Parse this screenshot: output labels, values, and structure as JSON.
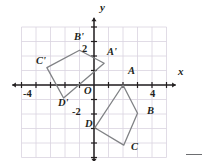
{
  "figure": {
    "origin_px": {
      "x": 94,
      "y": 85
    },
    "unit_px": 14.5,
    "colors": {
      "grid": "#d9d3e0",
      "axis": "#231f20",
      "shape": "#808285",
      "label": "#231f20",
      "background": "#ffffff"
    },
    "axes": {
      "x_label": "x",
      "y_label": "y",
      "x_tick_labels": [
        {
          "text": "-4",
          "value": -4
        },
        {
          "text": "4",
          "value": 4
        }
      ],
      "y_tick_labels": [
        {
          "text": "2",
          "value": 2
        },
        {
          "text": "-2",
          "value": -2
        }
      ],
      "origin_label": "O",
      "x_range": [
        -5.5,
        5.5
      ],
      "y_range": [
        -5.2,
        4.5
      ]
    },
    "shapes": [
      {
        "name": "ABCD",
        "vertices": [
          {
            "label": "A",
            "x": 2.0,
            "y": 0.0
          },
          {
            "label": "B",
            "x": 3.0,
            "y": -1.95
          },
          {
            "label": "C",
            "x": 2.05,
            "y": -4.15
          },
          {
            "label": "D",
            "x": 0.05,
            "y": -2.95
          }
        ]
      },
      {
        "name": "A'B'C'D'",
        "vertices": [
          {
            "label": "A'",
            "x": 0.7,
            "y": 1.5
          },
          {
            "label": "B'",
            "x": -1.0,
            "y": 2.4
          },
          {
            "label": "C'",
            "x": -3.25,
            "y": 1.2
          },
          {
            "label": "D'",
            "x": -2.1,
            "y": -0.9
          }
        ]
      }
    ],
    "point_labels": [
      {
        "text": "A",
        "px": 128,
        "py": 72
      },
      {
        "text": "B",
        "px": 147,
        "py": 112
      },
      {
        "text": "C",
        "px": 131,
        "py": 148
      },
      {
        "text": "D",
        "px": 85,
        "py": 125
      },
      {
        "text": "A'",
        "px": 107,
        "py": 53
      },
      {
        "text": "B'",
        "px": 74,
        "py": 38
      },
      {
        "text": "C'",
        "px": 36,
        "py": 62
      },
      {
        "text": "D'",
        "px": 58,
        "py": 104
      }
    ],
    "axis_labels": [
      {
        "text": "x",
        "px": 178,
        "py": 73
      },
      {
        "text": "y",
        "px": 100,
        "py": 8
      }
    ],
    "tick_labels": [
      {
        "text": "-4",
        "px": 23,
        "py": 89
      },
      {
        "text": "4",
        "px": 150,
        "py": 89
      },
      {
        "text": "2",
        "px": 82,
        "py": 44
      },
      {
        "text": "-2",
        "px": 73,
        "py": 107
      },
      {
        "text": "O",
        "px": 84,
        "py": 87
      }
    ]
  }
}
